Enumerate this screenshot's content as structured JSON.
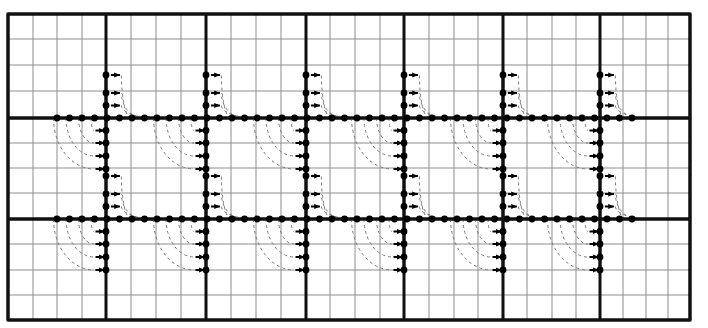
{
  "figure": {
    "type": "lattice-diagram",
    "canvas": {
      "width": 708,
      "height": 328,
      "background": "#ffffff"
    },
    "colors": {
      "major_grid": "#111111",
      "minor_grid": "#8d8d8d",
      "border": "#111111",
      "node": "#000000",
      "arrow": "#000000",
      "arc": "#7a7a7a"
    },
    "grid": {
      "plot_left": 8,
      "plot_top": 14,
      "plot_right": 690,
      "plot_bottom": 320,
      "cell_width": 24.9,
      "cell_height": 25.4,
      "minor_line_width": 1,
      "major_line_width": 3.0,
      "border_line_width": 3.0,
      "major_every_cells": 4,
      "major_x": [
        8,
        106,
        206,
        306,
        404,
        503,
        600,
        690
      ],
      "major_y": [
        14,
        118,
        219,
        320
      ],
      "minor_x": [
        33,
        57,
        82,
        131,
        156,
        181,
        231,
        256,
        281,
        330,
        355,
        380,
        429,
        454,
        478,
        527,
        552,
        576,
        623,
        646,
        668
      ],
      "minor_y": [
        39,
        65,
        91,
        143,
        168,
        193,
        244,
        270,
        295
      ]
    },
    "axes": {
      "horizontal_rows_y": [
        118,
        219
      ],
      "vertical_columns_x": [
        106,
        206,
        306,
        404,
        503,
        600
      ],
      "node_spacing": 12.5,
      "node_radius": 3.4,
      "row_node_start_x": 57,
      "row_node_end_x": 638
    },
    "motif": {
      "name": "corner-flow-unit",
      "description": "At each intersection of a horizontal node row and a vertical major gridline, three nodes with rightward arrows sit above the row on the vertical line, four nodes with rightward arrows sit below it, and dashed quarter-arcs connect row nodes to vertical-line nodes.",
      "up_node_offsets": [
        -43,
        -25,
        -12.5
      ],
      "down_node_offsets": [
        12.5,
        25,
        38,
        51
      ],
      "arrow_length": 9,
      "arrow_head_width": 6,
      "arrow_direction": "right",
      "arc_style": "dashed",
      "arc_dash_pattern": "3 3",
      "arc_width": 1
    }
  },
  "legend": {
    "items": [
      {
        "symbol": "filled-circle",
        "label": "node"
      },
      {
        "symbol": "right-arrow",
        "label": "directed edge"
      },
      {
        "symbol": "dashed-arc",
        "label": "transition arc"
      }
    ]
  }
}
